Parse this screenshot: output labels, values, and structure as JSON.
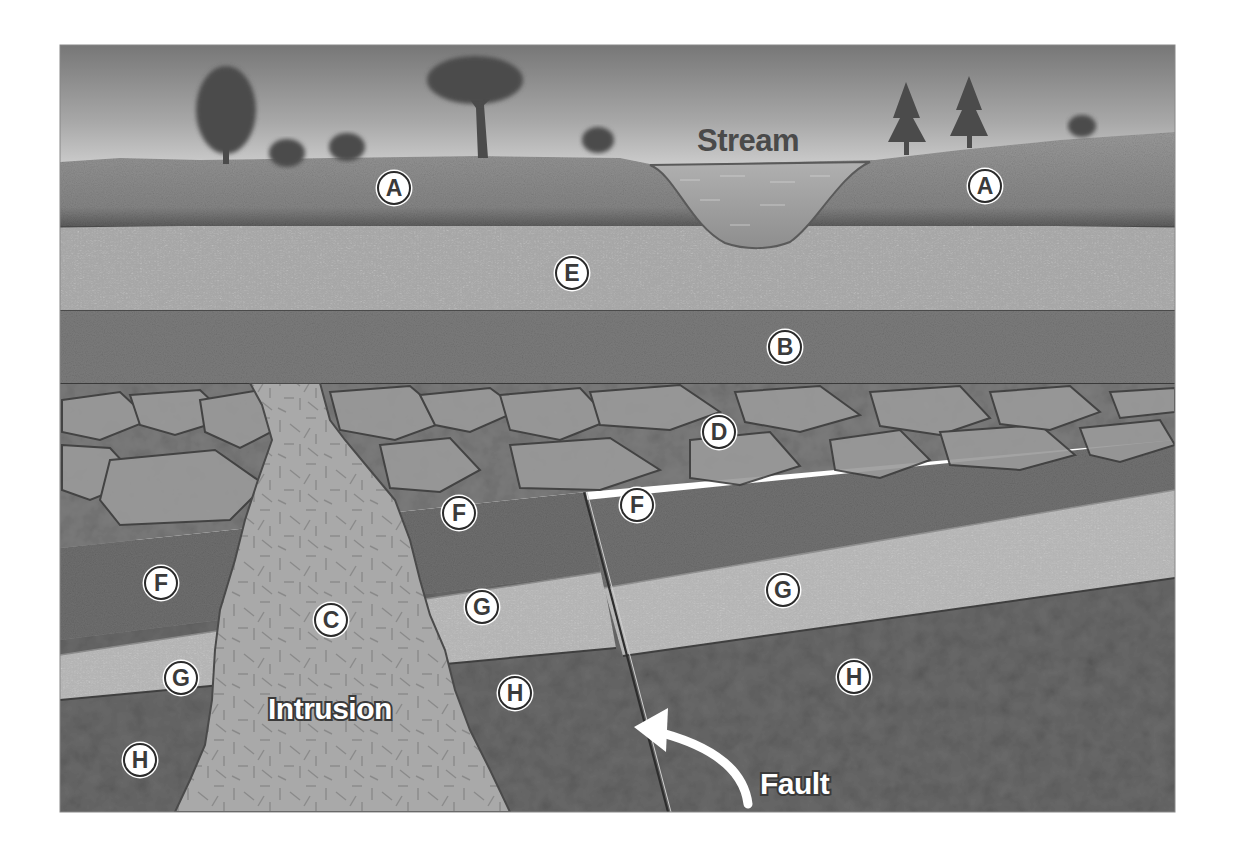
{
  "diagram": {
    "colors": {
      "background": "#ffffff",
      "sky_top": "#7a7a7a",
      "sky_bottom": "#d8d8d8",
      "layer_A": "#8a8a8a",
      "layer_E": "#a6a6a6",
      "layer_B": "#7b7b7b",
      "layer_D": "#7f7f7f",
      "layer_F": "#6e6e6e",
      "layer_G": "#b2b2b2",
      "layer_H": "#666666",
      "intrusion_C": "#a9a9a9",
      "stream": "#9a9a9a"
    },
    "captions": {
      "stream": "Stream",
      "intrusion": "Intrusion",
      "fault": "Fault"
    },
    "labels": [
      {
        "id": "A",
        "x": 394,
        "y": 188
      },
      {
        "id": "A",
        "x": 985,
        "y": 186
      },
      {
        "id": "E",
        "x": 572,
        "y": 273
      },
      {
        "id": "B",
        "x": 785,
        "y": 347
      },
      {
        "id": "D",
        "x": 719,
        "y": 432
      },
      {
        "id": "F",
        "x": 161,
        "y": 583
      },
      {
        "id": "F",
        "x": 459,
        "y": 513
      },
      {
        "id": "F",
        "x": 637,
        "y": 505
      },
      {
        "id": "C",
        "x": 331,
        "y": 620
      },
      {
        "id": "G",
        "x": 181,
        "y": 678
      },
      {
        "id": "G",
        "x": 482,
        "y": 607
      },
      {
        "id": "G",
        "x": 783,
        "y": 590
      },
      {
        "id": "H",
        "x": 140,
        "y": 760
      },
      {
        "id": "H",
        "x": 515,
        "y": 693
      },
      {
        "id": "H",
        "x": 854,
        "y": 677
      }
    ],
    "layers": [
      "A",
      "E",
      "B",
      "D",
      "F",
      "G",
      "H",
      "C"
    ]
  }
}
